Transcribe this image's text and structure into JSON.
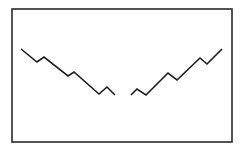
{
  "diagram": {
    "frame": {
      "x": 12,
      "y": 9,
      "width": 220,
      "height": 133,
      "stroke": "#2a2a2a",
      "stroke_width": 1.6
    },
    "lines": [
      {
        "name": "left-zigzag-line",
        "stroke": "#1e1e1e",
        "points": [
          [
            21,
            49
          ],
          [
            37,
            62
          ],
          [
            44,
            57
          ],
          [
            68,
            76
          ],
          [
            74,
            72
          ],
          [
            99,
            94
          ],
          [
            107,
            87
          ],
          [
            115,
            95
          ]
        ]
      },
      {
        "name": "right-zigzag-line",
        "stroke": "#1e1e1e",
        "points": [
          [
            131,
            95
          ],
          [
            137,
            89
          ],
          [
            146,
            95
          ],
          [
            168,
            73
          ],
          [
            177,
            80
          ],
          [
            200,
            58
          ],
          [
            207,
            64
          ],
          [
            222,
            49
          ]
        ]
      }
    ]
  }
}
